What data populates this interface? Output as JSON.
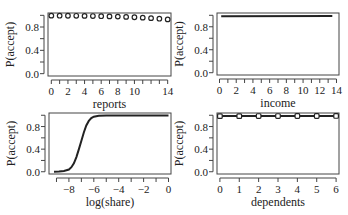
{
  "chart_data": [
    {
      "type": "scatter",
      "title": "",
      "xlabel": "reports",
      "ylabel": "P(accept)",
      "xlim": [
        -0.4,
        14.4
      ],
      "ylim": [
        -0.04,
        1.04
      ],
      "xticks": [
        0,
        1,
        2,
        3,
        4,
        5,
        6,
        7,
        8,
        9,
        10,
        11,
        12,
        13,
        14
      ],
      "xtick_labels": [
        "0",
        "",
        "2",
        "",
        "4",
        "",
        "6",
        "",
        "8",
        "",
        "10",
        "",
        "",
        "",
        "14"
      ],
      "yticks": [
        0.0,
        0.2,
        0.4,
        0.6,
        0.8,
        1.0
      ],
      "ytick_labels": [
        "0.0",
        "",
        "0.4",
        "",
        "0.8",
        ""
      ],
      "grid": false,
      "marker": "circle-open",
      "x": [
        0,
        1,
        2,
        3,
        4,
        5,
        6,
        7,
        8,
        9,
        10,
        11,
        12,
        13,
        14
      ],
      "y": [
        0.995,
        0.994,
        0.993,
        0.992,
        0.99,
        0.988,
        0.985,
        0.982,
        0.978,
        0.973,
        0.967,
        0.96,
        0.952,
        0.942,
        0.93
      ]
    },
    {
      "type": "line",
      "title": "",
      "xlabel": "income",
      "ylabel": "P(accept)",
      "xlim": [
        -0.3,
        14.3
      ],
      "ylim": [
        -0.04,
        1.04
      ],
      "xticks": [
        0,
        1,
        2,
        3,
        4,
        5,
        6,
        7,
        8,
        9,
        10,
        11,
        12,
        13,
        14
      ],
      "xtick_labels": [
        "0",
        "",
        "2",
        "",
        "4",
        "",
        "6",
        "",
        "8",
        "",
        "10",
        "",
        "12",
        "",
        "14"
      ],
      "yticks": [
        0.0,
        0.2,
        0.4,
        0.6,
        0.8,
        1.0
      ],
      "ytick_labels": [
        "0.0",
        "",
        "0.4",
        "",
        "0.8",
        ""
      ],
      "grid": false,
      "x": [
        0.2,
        13.5
      ],
      "y": [
        0.985,
        0.99
      ]
    },
    {
      "type": "line",
      "title": "",
      "xlabel": "log(share)",
      "ylabel": "P(accept)",
      "xlim": [
        -9.6,
        0.2
      ],
      "ylim": [
        -0.04,
        1.04
      ],
      "xticks": [
        -9,
        -8,
        -7,
        -6,
        -5,
        -4,
        -3,
        -2,
        -1,
        0
      ],
      "xtick_labels": [
        "",
        "-8",
        "",
        "-6",
        "",
        "-4",
        "",
        "-2",
        "",
        "0"
      ],
      "yticks": [
        0.0,
        0.2,
        0.4,
        0.6,
        0.8,
        1.0
      ],
      "ytick_labels": [
        "0.0",
        "",
        "0.4",
        "",
        "0.8",
        ""
      ],
      "grid": false,
      "x": [
        -9.2,
        -8.8,
        -8.4,
        -8.0,
        -7.8,
        -7.6,
        -7.4,
        -7.2,
        -7.0,
        -6.8,
        -6.6,
        -6.4,
        -6.2,
        -6.0,
        -5.6,
        -5.0,
        -4.0,
        -2.0,
        0.0
      ],
      "y": [
        0.0,
        0.005,
        0.015,
        0.04,
        0.08,
        0.15,
        0.26,
        0.4,
        0.55,
        0.7,
        0.82,
        0.9,
        0.95,
        0.975,
        0.99,
        0.995,
        0.997,
        0.998,
        0.998
      ]
    },
    {
      "type": "line",
      "title": "",
      "xlabel": "dependents",
      "ylabel": "P(accept)",
      "xlim": [
        -0.15,
        6.15
      ],
      "ylim": [
        -0.04,
        1.04
      ],
      "xticks": [
        0,
        1,
        2,
        3,
        4,
        5,
        6
      ],
      "xtick_labels": [
        "0",
        "1",
        "2",
        "3",
        "4",
        "5",
        "6"
      ],
      "yticks": [
        0.0,
        0.2,
        0.4,
        0.6,
        0.8,
        1.0
      ],
      "ytick_labels": [
        "0.0",
        "",
        "0.4",
        "",
        "0.8",
        ""
      ],
      "grid": false,
      "marker": "square-open",
      "x": [
        0,
        1,
        2,
        3,
        4,
        5,
        6
      ],
      "y": [
        0.985,
        0.985,
        0.986,
        0.986,
        0.987,
        0.987,
        0.988
      ]
    }
  ],
  "panels": [
    {
      "xlabel": "reports",
      "ylabel": "P(accept)"
    },
    {
      "xlabel": "income",
      "ylabel": "P(accept)"
    },
    {
      "xlabel": "log(share)",
      "ylabel": "P(accept)"
    },
    {
      "xlabel": "dependents",
      "ylabel": "P(accept)"
    }
  ],
  "style": {
    "ink": "#222222",
    "axis": "#444444",
    "background": "#ffffff"
  }
}
